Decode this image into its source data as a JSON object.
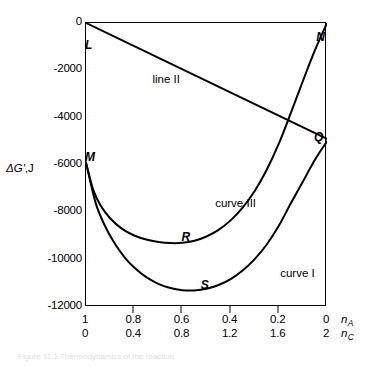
{
  "figure": {
    "y_axis_title_delta": "Δ",
    "y_axis_title_symbol": "G'",
    "y_axis_title_unit": ",J",
    "caption": "Figure 11.1  Thermodynamics of the reaction"
  },
  "chart_data": {
    "type": "line",
    "title": "",
    "xlabel": "",
    "ylabel": "ΔG',J",
    "xlim": [
      1,
      0
    ],
    "ylim": [
      -12000,
      0
    ],
    "grid": false,
    "legend": "in-plot annotations",
    "x_axes": [
      {
        "name": "n_A",
        "var": "n",
        "subscript": "A",
        "ticks": [
          "1",
          "0.8",
          "0.6",
          "0.4",
          "0.2",
          "0"
        ],
        "values": [
          1,
          0.8,
          0.6,
          0.4,
          0.2,
          0
        ]
      },
      {
        "name": "n_C",
        "var": "n",
        "subscript": "C",
        "ticks": [
          "0",
          "0.4",
          "0.8",
          "1.2",
          "1.6",
          "2"
        ],
        "values": [
          0,
          0.4,
          0.8,
          1.2,
          1.6,
          2
        ]
      }
    ],
    "y_ticks": [
      "0",
      "-2000",
      "-4000",
      "-6000",
      "-8000",
      "-10000",
      "-12000"
    ],
    "y_tick_values": [
      0,
      -2000,
      -4000,
      -6000,
      -8000,
      -10000,
      -12000
    ],
    "series": [
      {
        "name": "line II",
        "label": "line II",
        "kind": "line",
        "endpoints_nA": [
          1,
          0
        ],
        "endpoints_y": [
          0,
          -4900
        ],
        "points": [
          [
            1,
            0
          ],
          [
            0,
            -4900
          ]
        ]
      },
      {
        "name": "curve III",
        "label": "curve III",
        "kind": "curve",
        "points": [
          [
            1.0,
            -5900
          ],
          [
            0.97,
            -7050
          ],
          [
            0.94,
            -7700
          ],
          [
            0.9,
            -8250
          ],
          [
            0.85,
            -8700
          ],
          [
            0.8,
            -8980
          ],
          [
            0.75,
            -9150
          ],
          [
            0.7,
            -9250
          ],
          [
            0.65,
            -9300
          ],
          [
            0.6,
            -9290
          ],
          [
            0.55,
            -9200
          ],
          [
            0.5,
            -9020
          ],
          [
            0.45,
            -8740
          ],
          [
            0.4,
            -8340
          ],
          [
            0.35,
            -7800
          ],
          [
            0.3,
            -7100
          ],
          [
            0.25,
            -6200
          ],
          [
            0.2,
            -5100
          ],
          [
            0.15,
            -3800
          ],
          [
            0.1,
            -2450
          ],
          [
            0.05,
            -1150
          ],
          [
            0.0,
            0
          ]
        ]
      },
      {
        "name": "curve I",
        "label": "curve I",
        "kind": "curve",
        "points": [
          [
            1.0,
            -5900
          ],
          [
            0.96,
            -7600
          ],
          [
            0.92,
            -8600
          ],
          [
            0.88,
            -9330
          ],
          [
            0.84,
            -9900
          ],
          [
            0.8,
            -10330
          ],
          [
            0.75,
            -10740
          ],
          [
            0.7,
            -11020
          ],
          [
            0.65,
            -11200
          ],
          [
            0.6,
            -11290
          ],
          [
            0.55,
            -11300
          ],
          [
            0.5,
            -11230
          ],
          [
            0.45,
            -11070
          ],
          [
            0.4,
            -10820
          ],
          [
            0.35,
            -10460
          ],
          [
            0.3,
            -9980
          ],
          [
            0.25,
            -9360
          ],
          [
            0.2,
            -8570
          ],
          [
            0.15,
            -7620
          ],
          [
            0.1,
            -6700
          ],
          [
            0.05,
            -5780
          ],
          [
            0.0,
            -5000
          ]
        ]
      }
    ],
    "point_labels": [
      {
        "name": "L",
        "text": "L",
        "nA": 1.0,
        "y": -700,
        "desc": "start of line II at top-left"
      },
      {
        "name": "M",
        "text": "M",
        "nA": 1.0,
        "y": -5450,
        "desc": "common start of curve I and curve III on left axis"
      },
      {
        "name": "N",
        "text": "N",
        "nA": 0.04,
        "y": -400,
        "desc": "end of curve III at top-right"
      },
      {
        "name": "Q",
        "text": "Q",
        "nA": 0.05,
        "y": -4600,
        "desc": "end of line II / curve I region at right axis"
      },
      {
        "name": "R",
        "text": "R",
        "nA": 0.6,
        "y": -8850,
        "desc": "minimum of curve III"
      },
      {
        "name": "S",
        "text": "S",
        "nA": 0.52,
        "y": -10850,
        "desc": "minimum of curve I"
      }
    ],
    "curve_annotations": [
      {
        "name": "line-II-label",
        "text": "line II",
        "nA": 0.72,
        "y": -2150
      },
      {
        "name": "curve-III-label",
        "text": "curve III",
        "nA": 0.46,
        "y": -7400
      },
      {
        "name": "curve-I-label",
        "text": "curve I",
        "nA": 0.19,
        "y": -10350
      }
    ]
  }
}
